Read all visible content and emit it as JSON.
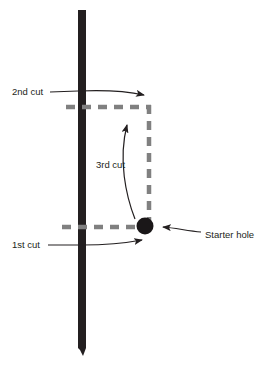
{
  "diagram": {
    "colors": {
      "workpiece": "#231f20",
      "cut_line": "#808080",
      "starter_hole": "#1a1718",
      "leader": "#231f20",
      "text": "#231f20",
      "background": "#ffffff"
    },
    "workpiece": {
      "name": "vertical-board",
      "x": 78,
      "y_top": 10,
      "y_bottom": 356,
      "width": 8
    },
    "starter_hole": {
      "name": "starter-hole",
      "cx": 145,
      "cy": 226,
      "r": 8.5
    },
    "cut_paths": [
      {
        "name": "second-cut-line",
        "orientation": "horizontal",
        "x1": 66,
        "y1": 107,
        "x2": 151,
        "y2": 107
      },
      {
        "name": "third-cut-line",
        "orientation": "vertical",
        "x1": 149,
        "y1": 105,
        "x2": 149,
        "y2": 224
      },
      {
        "name": "first-cut-line",
        "orientation": "horizontal",
        "x1": 62,
        "y1": 227,
        "x2": 143,
        "y2": 227
      }
    ],
    "labels": [
      {
        "id": "second-cut",
        "text": "2nd cut",
        "x": 12,
        "y": 92,
        "anchor": "start"
      },
      {
        "id": "third-cut",
        "text": "3rd cut",
        "x": 96,
        "y": 165,
        "anchor": "start"
      },
      {
        "id": "first-cut",
        "text": "1st cut",
        "x": 12,
        "y": 245,
        "anchor": "start"
      },
      {
        "id": "starter-hole",
        "text": "Starter hole",
        "x": 205,
        "y": 235,
        "anchor": "start"
      }
    ],
    "leaders": [
      {
        "id": "second-cut-leader",
        "path": "M 50 92 L 78 91 C 100 90 126 91 146 95",
        "arrow": true
      },
      {
        "id": "third-cut-leader",
        "path": "M 135 219 C 126 196 118 160 126 122",
        "arrow": true
      },
      {
        "id": "first-cut-leader",
        "path": "M 48 245 L 82 245 C 104 245 128 243 145 239",
        "arrow": true
      },
      {
        "id": "starter-hole-leader",
        "path": "M 200 232 C 186 230 176 227 160 227",
        "arrow": true
      }
    ]
  }
}
